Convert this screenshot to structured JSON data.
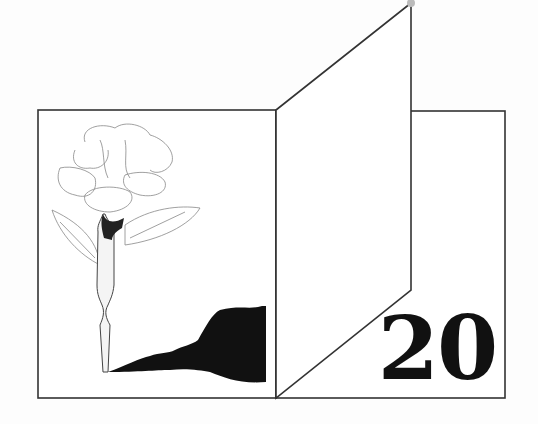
{
  "illustration": {
    "subject": "rose-pen-book",
    "number_label": "20",
    "colors": {
      "ink": "#111111",
      "line": "#333333",
      "paper": "#ffffff",
      "sketch": "#888888"
    }
  }
}
